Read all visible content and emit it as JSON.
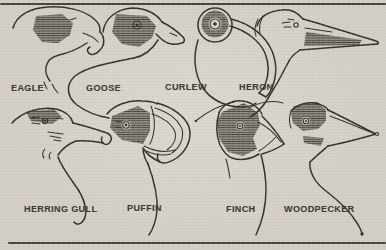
{
  "figure": {
    "description_labels_only": "Comparative diagram of bird heads and beak shapes",
    "colors": {
      "paper": "#d3cfc6",
      "ink": "#32302a",
      "label": "#3a372f",
      "rule": "#45423a"
    },
    "birds": [
      {
        "id": "eagle",
        "label": "EAGLE",
        "row": "top"
      },
      {
        "id": "goose",
        "label": "GOOSE",
        "row": "top"
      },
      {
        "id": "curlew",
        "label": "CURLEW",
        "row": "top"
      },
      {
        "id": "heron",
        "label": "HERON",
        "row": "top"
      },
      {
        "id": "herring-gull",
        "label": "HERRING GULL",
        "row": "bottom"
      },
      {
        "id": "puffin",
        "label": "PUFFIN",
        "row": "bottom"
      },
      {
        "id": "finch",
        "label": "FINCH",
        "row": "bottom"
      },
      {
        "id": "woodpecker",
        "label": "WOODPECKER",
        "row": "bottom"
      }
    ]
  }
}
